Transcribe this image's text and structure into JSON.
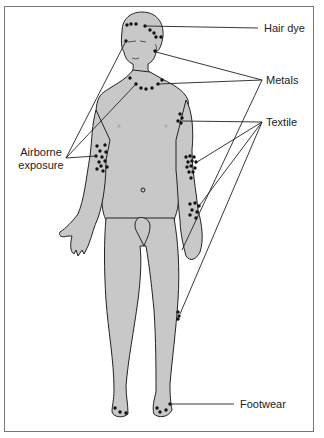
{
  "figure": {
    "colors": {
      "skin": "#c8c8c8",
      "outline": "#222222",
      "dot": "#111111",
      "leader": "#222222",
      "frame": "#777777"
    }
  },
  "labels": {
    "hair_dye": "Hair dye",
    "metals": "Metals",
    "textile": "Textile",
    "airborne_line1": "Airborne",
    "airborne_line2": "exposure",
    "footwear": "Footwear"
  }
}
